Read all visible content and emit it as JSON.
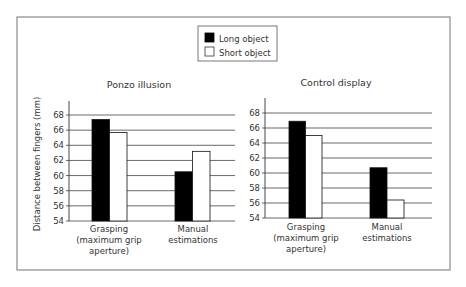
{
  "legend": {
    "items": [
      {
        "label": "Long object",
        "color": "#000000"
      },
      {
        "label": "Short object",
        "color": "#ffffff"
      }
    ]
  },
  "chart_data": [
    {
      "type": "bar",
      "title": "Ponzo illusion",
      "xlabel": "",
      "ylabel": "Distance between fingers (mm)",
      "ylim": [
        54,
        70
      ],
      "yticks": [
        54,
        56,
        58,
        60,
        62,
        64,
        66,
        68
      ],
      "grid": true,
      "legend_position": "top-center",
      "categories": [
        [
          "Grasping",
          "(maximum grip",
          "aperture)"
        ],
        [
          "Manual",
          "estimations"
        ]
      ],
      "series": [
        {
          "name": "Long object",
          "values": [
            67.4,
            60.5
          ]
        },
        {
          "name": "Short object",
          "values": [
            65.7,
            63.2
          ]
        }
      ]
    },
    {
      "type": "bar",
      "title": "Control display",
      "xlabel": "",
      "ylabel": "",
      "ylim": [
        54,
        70
      ],
      "yticks": [
        54,
        56,
        58,
        60,
        62,
        64,
        66,
        68
      ],
      "grid": true,
      "legend_position": "top-center",
      "categories": [
        [
          "Grasping",
          "(maximum grip",
          "aperture)"
        ],
        [
          "Manual",
          "estimations"
        ]
      ],
      "series": [
        {
          "name": "Long object",
          "values": [
            66.9,
            60.7
          ]
        },
        {
          "name": "Short object",
          "values": [
            65.0,
            56.4
          ]
        }
      ]
    }
  ]
}
